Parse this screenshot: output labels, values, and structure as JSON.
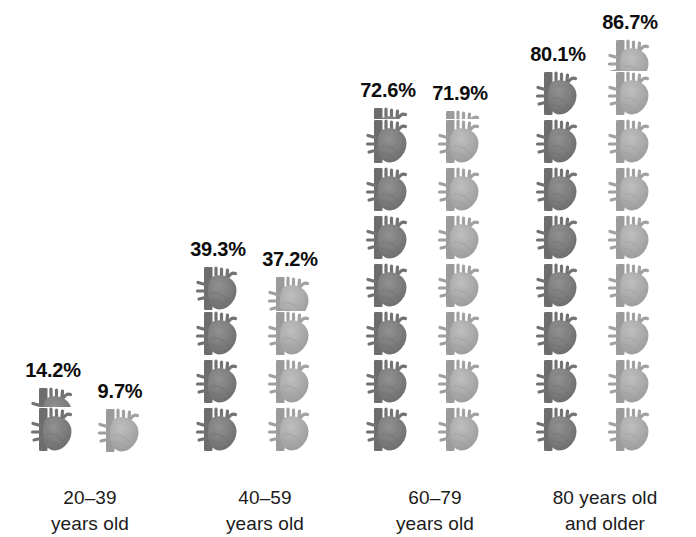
{
  "chart_data": {
    "type": "bar",
    "subtype": "pictogram",
    "title": "",
    "xlabel": "",
    "ylabel": "",
    "unit": "percent",
    "icon": "heart-icon",
    "icon_value": 10,
    "icon_note": "each heart icon represents 10%",
    "categories": [
      "20–39 years old",
      "40–59 years old",
      "60–79 years old",
      "80 years old and older"
    ],
    "series": [
      {
        "name": "series-1",
        "color": "#7b7b7b",
        "values": [
          14.2,
          39.3,
          72.6,
          80.1
        ],
        "labels": [
          "14.2%",
          "39.3%",
          "72.6%",
          "80.1%"
        ]
      },
      {
        "name": "series-2",
        "color": "#a9a9a9",
        "values": [
          9.7,
          37.2,
          71.9,
          86.7
        ],
        "labels": [
          "9.7%",
          "37.2%",
          "71.9%",
          "86.7%"
        ]
      }
    ],
    "ylim": [
      0,
      90
    ],
    "grid": false,
    "legend": "none"
  },
  "groups": [
    {
      "label_line1": "20–39",
      "label_line2": "years old",
      "left": 10,
      "columns": [
        {
          "value": 14.2,
          "label": "14.2%",
          "color": "#7b7b7b",
          "x": 20
        },
        {
          "value": 9.7,
          "label": "9.7%",
          "color": "#a9a9a9",
          "x": 87
        }
      ]
    },
    {
      "label_line1": "40–59",
      "label_line2": "years old",
      "left": 185,
      "columns": [
        {
          "value": 39.3,
          "label": "39.3%",
          "color": "#7b7b7b",
          "x": 10
        },
        {
          "value": 37.2,
          "label": "37.2%",
          "color": "#a9a9a9",
          "x": 82
        }
      ]
    },
    {
      "label_line1": "60–79",
      "label_line2": "years old",
      "left": 355,
      "columns": [
        {
          "value": 72.6,
          "label": "72.6%",
          "color": "#7b7b7b",
          "x": 10
        },
        {
          "value": 71.9,
          "label": "71.9%",
          "color": "#a9a9a9",
          "x": 82
        }
      ]
    },
    {
      "label_line1": "80 years old",
      "label_line2": "and older",
      "left": 525,
      "columns": [
        {
          "value": 80.1,
          "label": "80.1%",
          "color": "#7b7b7b",
          "x": 10
        },
        {
          "value": 86.7,
          "label": "86.7%",
          "color": "#a9a9a9",
          "x": 82
        }
      ]
    }
  ]
}
